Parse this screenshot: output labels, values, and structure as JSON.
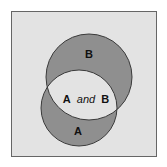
{
  "diagram": {
    "type": "venn",
    "sets": [
      {
        "id": "A",
        "label": "A"
      },
      {
        "id": "B",
        "label": "B"
      }
    ],
    "intersection": {
      "label_left": "A",
      "label_mid": "and",
      "label_right": "B"
    },
    "colors": {
      "background": "#e3e3e3",
      "frame": "#666666",
      "set_fill": "#8f8f8f",
      "intersection_fill": "#e3e3e3",
      "outline": "#3a3a3a"
    }
  }
}
